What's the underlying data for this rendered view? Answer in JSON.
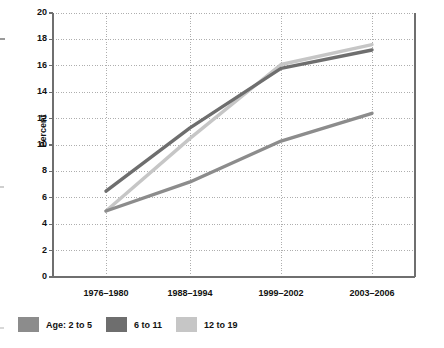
{
  "chart_data": {
    "type": "line",
    "title": "",
    "xlabel": "",
    "ylabel": "Percent",
    "categories": [
      "1976–1980",
      "1988–1994",
      "1999–2002",
      "2003–2006"
    ],
    "ylim": [
      0,
      20
    ],
    "ytick_step": 2,
    "yticks": [
      "0",
      "2",
      "4",
      "6",
      "8",
      "10",
      "12",
      "14",
      "16",
      "18",
      "20"
    ],
    "grid": true,
    "legend_position": "bottom-left",
    "series": [
      {
        "name": "Age:  2 to 5",
        "legend_label": "Age:  2 to 5",
        "color": "#8c8c8c",
        "values": [
          5.0,
          7.2,
          10.3,
          12.4
        ]
      },
      {
        "name": "6 to 11",
        "legend_label": "6 to 11",
        "color": "#6e6e6e",
        "values": [
          6.5,
          11.3,
          15.8,
          17.2
        ]
      },
      {
        "name": "12 to 19",
        "legend_label": "12 to 19",
        "color": "#c6c6c6",
        "values": [
          5.0,
          10.5,
          16.1,
          17.6
        ]
      }
    ]
  },
  "axis": {
    "y_label": "Percent"
  },
  "colors": {
    "axis_line": "#6f6f6f",
    "grid_line": "#9a9a9a",
    "text": "#111111",
    "background": "#ffffff"
  }
}
